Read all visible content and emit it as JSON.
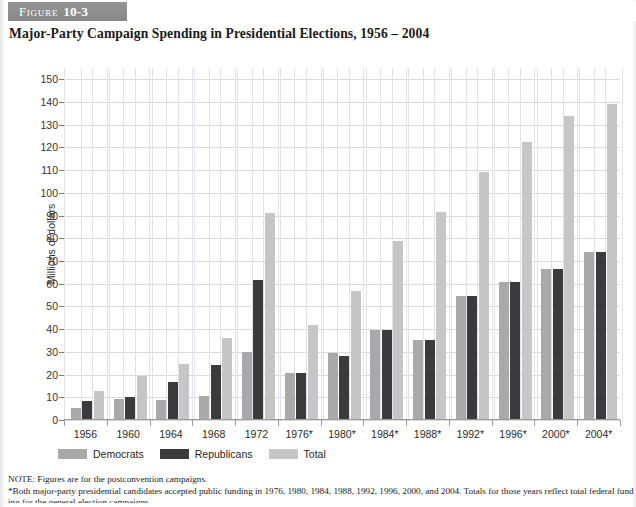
{
  "figure": {
    "label": "Figure",
    "number": "10-3",
    "title": "Major-Party Campaign Spending in Presidential Elections, 1956 – 2004"
  },
  "legend": {
    "items": [
      {
        "label": "Democrats",
        "color": "#a9a9a9",
        "key": "democrats"
      },
      {
        "label": "Republicans",
        "color": "#3b3b3b",
        "key": "republicans"
      },
      {
        "label": "Total",
        "color": "#c6c6c6",
        "key": "total"
      }
    ]
  },
  "notes": {
    "note": "NOTE: Figures are for the postconvention campaigns.",
    "asterisk": "*Both major-party presidential candidates accepted public funding in 1976, 1980, 1984, 1988, 1992, 1996, 2000, and 2004. Totals for those years reflect total federal fund-",
    "clipped": "ing for the general election campaigns."
  },
  "chart_data": {
    "type": "bar",
    "title": "Major-Party Campaign Spending in Presidential Elections, 1956 – 2004",
    "xlabel": "",
    "ylabel": "Millions of dollars",
    "ylim": [
      0,
      155
    ],
    "yticks": [
      0,
      10,
      20,
      30,
      40,
      50,
      60,
      70,
      80,
      90,
      100,
      110,
      120,
      130,
      140,
      150
    ],
    "grid": true,
    "legend_position": "below-axis-left",
    "categories": [
      "1956",
      "1960",
      "1964",
      "1968",
      "1972",
      "1976*",
      "1980*",
      "1984*",
      "1988*",
      "1992*",
      "1996*",
      "2000*",
      "2004*"
    ],
    "series": [
      {
        "name": "Democrats",
        "color": "#a9a9a9",
        "values": [
          5.0,
          9.0,
          8.2,
          10.3,
          29.4,
          20.3,
          29.0,
          39.0,
          35.0,
          54.0,
          60.4,
          66.0,
          73.5
        ]
      },
      {
        "name": "Republicans",
        "color": "#3b3b3b",
        "values": [
          8.0,
          9.8,
          16.2,
          23.7,
          61.4,
          20.3,
          27.6,
          39.0,
          35.0,
          54.0,
          60.4,
          66.0,
          73.5
        ]
      },
      {
        "name": "Total",
        "color": "#c6c6c6",
        "values": [
          12.5,
          18.9,
          24.2,
          35.8,
          90.7,
          41.5,
          56.5,
          78.5,
          91.3,
          108.8,
          122.0,
          133.3,
          138.5
        ]
      }
    ]
  }
}
